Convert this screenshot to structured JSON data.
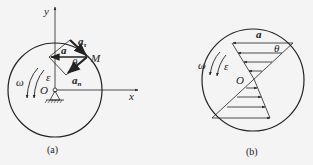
{
  "figure_a": {
    "caption": "(a)",
    "labels": {
      "y_axis": "y",
      "x_axis": "x",
      "origin": "O",
      "point": "M",
      "acceleration": "a",
      "tangential": "a",
      "tangential_sub": "τ",
      "normal": "a",
      "normal_sub": "n",
      "angle": "θ",
      "omega": "ω",
      "epsilon": "ε"
    }
  },
  "figure_b": {
    "caption": "(b)",
    "labels": {
      "acceleration": "a",
      "angle": "θ",
      "origin": "O",
      "omega": "ω",
      "epsilon": "ε"
    }
  },
  "colors": {
    "line": "#222222",
    "background": "#f4f4f4"
  }
}
